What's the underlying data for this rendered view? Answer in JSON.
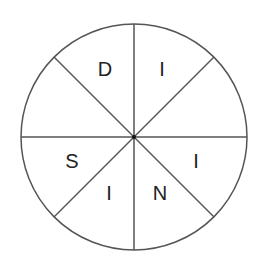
{
  "diagram": {
    "type": "divided-circle",
    "segments": 8,
    "center": {
      "x": 134,
      "y": 137
    },
    "radius": 113,
    "line_color": "#555555",
    "letter_color": "#222222",
    "letters": [
      {
        "id": "top-left",
        "char": "D",
        "x": 105,
        "y": 76
      },
      {
        "id": "top-right",
        "char": "I",
        "x": 162,
        "y": 76
      },
      {
        "id": "lower-left",
        "char": "S",
        "x": 72,
        "y": 168
      },
      {
        "id": "lower-right",
        "char": "I",
        "x": 196,
        "y": 168
      },
      {
        "id": "bottom-left",
        "char": "I",
        "x": 109,
        "y": 200
      },
      {
        "id": "bottom-right",
        "char": "N",
        "x": 160,
        "y": 200
      }
    ]
  }
}
